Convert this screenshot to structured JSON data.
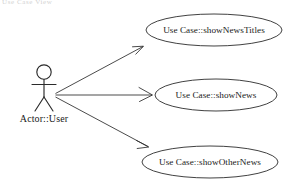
{
  "diagram": {
    "kind": "uml-use-case-diagram",
    "background_color": "#ffffff",
    "stroke_color": "#2b2b2b",
    "text_color": "#1a1a1a",
    "top_cropped_artifact": "Use Case View",
    "actor": {
      "label": "Actor::User",
      "icon": "stick-figure-actor",
      "x": 44,
      "label_x": 44,
      "label_y": 122
    },
    "use_cases": [
      {
        "id": "showNewsTitles",
        "label": "Use Case::showNewsTitles",
        "cx": 214,
        "cy": 30,
        "rx": 68,
        "ry": 16
      },
      {
        "id": "showNews",
        "label": "Use Case::showNews",
        "cx": 216,
        "cy": 95,
        "rx": 61,
        "ry": 16
      },
      {
        "id": "showOtherNews",
        "label": "Use Case::showOtherNews",
        "cx": 210,
        "cy": 162,
        "rx": 68,
        "ry": 16
      }
    ],
    "associations": [
      {
        "id": "user-to-showNewsTitles",
        "from": "Actor::User",
        "to": "Use Case::showNewsTitles",
        "arrow": "open-arrowhead"
      },
      {
        "id": "user-to-showNews",
        "from": "Actor::User",
        "to": "Use Case::showNews",
        "arrow": "open-arrowhead"
      },
      {
        "id": "user-to-showOtherNews",
        "from": "Actor::User",
        "to": "Use Case::showOtherNews",
        "arrow": "open-arrowhead"
      }
    ]
  }
}
